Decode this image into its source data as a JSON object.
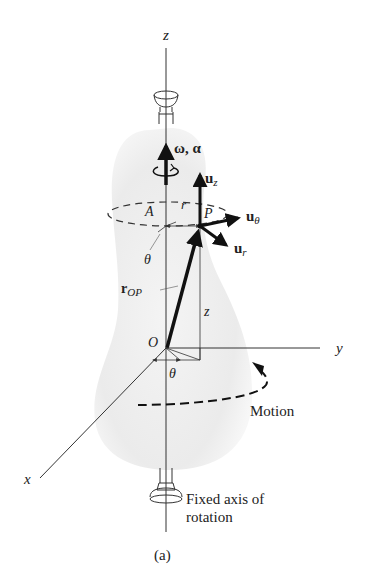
{
  "figure": {
    "caption": "(a)",
    "labels": {
      "z_axis": "z",
      "y_axis": "y",
      "x_axis": "x",
      "origin": "O",
      "omega_alpha": "ω, α",
      "u_z": "u",
      "u_z_sub": "z",
      "u_theta": "u",
      "u_theta_sub": "θ",
      "u_r": "u",
      "u_r_sub": "r",
      "point_A": "A",
      "point_P": "P",
      "radius_r": "r",
      "theta_upper": "θ",
      "theta_lower": "θ",
      "r_op": "r",
      "r_op_sub": "OP",
      "height_z": "z",
      "motion": "Motion",
      "fixed_axis_line1": "Fixed axis of",
      "fixed_axis_line2": "rotation"
    },
    "colors": {
      "line": "#333333",
      "vector": "#111111",
      "body_fill": "#ebebeb",
      "background": "#ffffff"
    }
  }
}
